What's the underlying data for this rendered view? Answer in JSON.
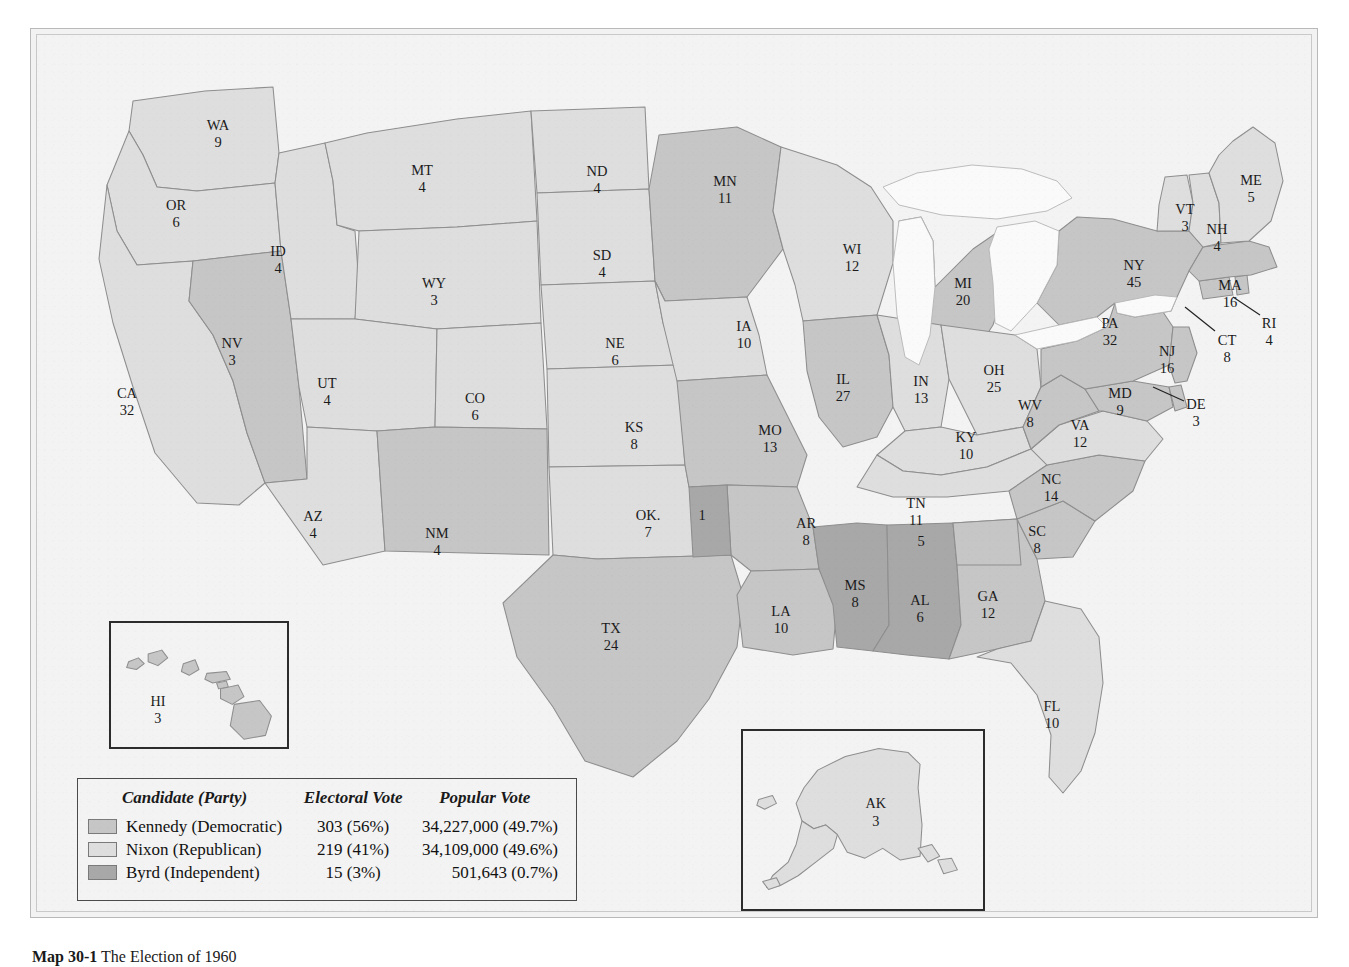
{
  "caption": {
    "label": "Map 30-1",
    "text": "The Election of 1960"
  },
  "colors": {
    "kennedy": "#c6c6c6",
    "nixon": "#dedede",
    "byrd": "#a8a8a8",
    "water": "#fafafa",
    "background": "#f3f3f3",
    "border": "#8e8e8e",
    "frame": "#b9b9b9"
  },
  "legend": {
    "headers": {
      "candidate": "Candidate (Party)",
      "electoral": "Electoral Vote",
      "popular": "Popular Vote"
    },
    "rows": [
      {
        "swatch": "kennedy",
        "candidate": "Kennedy (Democratic)",
        "electoral": "303 (56%)",
        "popular": "34,227,000 (49.7%)"
      },
      {
        "swatch": "nixon",
        "candidate": "Nixon (Republican)",
        "electoral": "219 (41%)",
        "popular": "34,109,000 (49.6%)"
      },
      {
        "swatch": "byrd",
        "candidate": "Byrd (Independent)",
        "electoral": "15 (3%)",
        "popular": "501,643 (0.7%)"
      }
    ]
  },
  "map": {
    "states": [
      {
        "code": "WA",
        "name": "Washington",
        "ev": "9",
        "winner": "nixon",
        "lx": 181,
        "ly": 92
      },
      {
        "code": "OR",
        "name": "Oregon",
        "ev": "6",
        "winner": "nixon",
        "lx": 139,
        "ly": 172
      },
      {
        "code": "CA",
        "name": "California",
        "ev": "32",
        "winner": "nixon",
        "lx": 90,
        "ly": 360
      },
      {
        "code": "NV",
        "name": "Nevada",
        "ev": "3",
        "winner": "kennedy",
        "lx": 195,
        "ly": 310
      },
      {
        "code": "ID",
        "name": "Idaho",
        "ev": "4",
        "winner": "nixon",
        "lx": 241,
        "ly": 218
      },
      {
        "code": "MT",
        "name": "Montana",
        "ev": "4",
        "winner": "nixon",
        "lx": 385,
        "ly": 137
      },
      {
        "code": "WY",
        "name": "Wyoming",
        "ev": "3",
        "winner": "nixon",
        "lx": 397,
        "ly": 250
      },
      {
        "code": "UT",
        "name": "Utah",
        "ev": "4",
        "winner": "nixon",
        "lx": 290,
        "ly": 350
      },
      {
        "code": "AZ",
        "name": "Arizona",
        "ev": "4",
        "winner": "nixon",
        "lx": 276,
        "ly": 483
      },
      {
        "code": "CO",
        "name": "Colorado",
        "ev": "6",
        "winner": "nixon",
        "lx": 438,
        "ly": 365
      },
      {
        "code": "NM",
        "name": "New Mexico",
        "ev": "4",
        "winner": "kennedy",
        "lx": 400,
        "ly": 500
      },
      {
        "code": "ND",
        "name": "North Dakota",
        "ev": "4",
        "winner": "nixon",
        "lx": 560,
        "ly": 138
      },
      {
        "code": "SD",
        "name": "South Dakota",
        "ev": "4",
        "winner": "nixon",
        "lx": 565,
        "ly": 222
      },
      {
        "code": "NE",
        "name": "Nebraska",
        "ev": "6",
        "winner": "nixon",
        "lx": 578,
        "ly": 310
      },
      {
        "code": "KS",
        "name": "Kansas",
        "ev": "8",
        "winner": "nixon",
        "lx": 597,
        "ly": 394
      },
      {
        "code": "OK.",
        "name": "Oklahoma",
        "ev": "7",
        "winner": "nixon",
        "lx": 611,
        "ly": 482
      },
      {
        "code": "TX",
        "name": "Texas",
        "ev": "24",
        "winner": "kennedy",
        "lx": 574,
        "ly": 595
      },
      {
        "code": "MN",
        "name": "Minnesota",
        "ev": "11",
        "winner": "kennedy",
        "lx": 688,
        "ly": 148
      },
      {
        "code": "IA",
        "name": "Iowa",
        "ev": "10",
        "winner": "nixon",
        "lx": 707,
        "ly": 293
      },
      {
        "code": "MO",
        "name": "Missouri",
        "ev": "13",
        "winner": "kennedy",
        "lx": 733,
        "ly": 397
      },
      {
        "code": "AR",
        "name": "Arkansas",
        "ev": "8",
        "winner": "kennedy",
        "lx": 769,
        "ly": 490
      },
      {
        "code": "LA",
        "name": "Louisiana",
        "ev": "10",
        "winner": "kennedy",
        "lx": 744,
        "ly": 578
      },
      {
        "code": "WI",
        "name": "Wisconsin",
        "ev": "12",
        "winner": "nixon",
        "lx": 815,
        "ly": 216
      },
      {
        "code": "IL",
        "name": "Illinois",
        "ev": "27",
        "winner": "kennedy",
        "lx": 806,
        "ly": 346
      },
      {
        "code": "MI",
        "name": "Michigan",
        "ev": "20",
        "winner": "kennedy",
        "lx": 926,
        "ly": 250
      },
      {
        "code": "IN",
        "name": "Indiana",
        "ev": "13",
        "winner": "nixon",
        "lx": 884,
        "ly": 348
      },
      {
        "code": "OH",
        "name": "Ohio",
        "ev": "25",
        "winner": "nixon",
        "lx": 957,
        "ly": 337
      },
      {
        "code": "KY",
        "name": "Kentucky",
        "ev": "10",
        "winner": "nixon",
        "lx": 929,
        "ly": 404
      },
      {
        "code": "TN",
        "name": "Tennessee",
        "ev": "11",
        "winner": "nixon",
        "lx": 879,
        "ly": 470
      },
      {
        "code": "MS",
        "name": "Mississippi",
        "ev": "8",
        "winner": "byrd",
        "lx": 818,
        "ly": 552
      },
      {
        "code": "AL",
        "name": "Alabama",
        "ev": "6",
        "winner": "byrd",
        "lx": 883,
        "ly": 567
      },
      {
        "code": "GA",
        "name": "Georgia",
        "ev": "12",
        "winner": "kennedy",
        "lx": 951,
        "ly": 563
      },
      {
        "code": "FL",
        "name": "Florida",
        "ev": "10",
        "winner": "nixon",
        "lx": 1015,
        "ly": 673
      },
      {
        "code": "SC",
        "name": "South Carolina",
        "ev": "8",
        "winner": "kennedy",
        "lx": 1000,
        "ly": 498
      },
      {
        "code": "NC",
        "name": "North Carolina",
        "ev": "14",
        "winner": "kennedy",
        "lx": 1014,
        "ly": 446
      },
      {
        "code": "VA",
        "name": "Virginia",
        "ev": "12",
        "winner": "nixon",
        "lx": 1043,
        "ly": 392
      },
      {
        "code": "WV",
        "name": "West Virginia",
        "ev": "8",
        "winner": "kennedy",
        "lx": 993,
        "ly": 372
      },
      {
        "code": "MD",
        "name": "Maryland",
        "ev": "9",
        "winner": "kennedy",
        "lx": 1083,
        "ly": 360
      },
      {
        "code": "DE",
        "name": "Delaware",
        "ev": "3",
        "winner": "kennedy",
        "lx": 1159,
        "ly": 371
      },
      {
        "code": "PA",
        "name": "Pennsylvania",
        "ev": "32",
        "winner": "kennedy",
        "lx": 1073,
        "ly": 290
      },
      {
        "code": "NJ",
        "name": "New Jersey",
        "ev": "16",
        "winner": "kennedy",
        "lx": 1130,
        "ly": 318
      },
      {
        "code": "NY",
        "name": "New York",
        "ev": "45",
        "winner": "kennedy",
        "lx": 1097,
        "ly": 232
      },
      {
        "code": "CT",
        "name": "Connecticut",
        "ev": "8",
        "winner": "kennedy",
        "lx": 1190,
        "ly": 307
      },
      {
        "code": "RI",
        "name": "Rhode Island",
        "ev": "4",
        "winner": "kennedy",
        "lx": 1232,
        "ly": 290
      },
      {
        "code": "MA",
        "name": "Massachusetts",
        "ev": "16",
        "winner": "kennedy",
        "lx": 1193,
        "ly": 252
      },
      {
        "code": "VT",
        "name": "Vermont",
        "ev": "3",
        "winner": "nixon",
        "lx": 1148,
        "ly": 176
      },
      {
        "code": "NH",
        "name": "New Hampshire",
        "ev": "4",
        "winner": "nixon",
        "lx": 1180,
        "ly": 196
      },
      {
        "code": "ME",
        "name": "Maine",
        "ev": "5",
        "winner": "nixon",
        "lx": 1214,
        "ly": 147
      }
    ],
    "split_districts": [
      {
        "id": "ok-byrd-sliver",
        "label": "1",
        "winner": "byrd",
        "lx": 665,
        "ly": 482,
        "state": "Oklahoma"
      },
      {
        "id": "al-kennedy",
        "label": "5",
        "winner": "kennedy",
        "lx": 884,
        "ly": 508,
        "state": "Alabama"
      }
    ],
    "insets": {
      "hawaii": {
        "code": "HI",
        "name": "Hawaii",
        "ev": "3",
        "winner": "kennedy"
      },
      "alaska": {
        "code": "AK",
        "name": "Alaska",
        "ev": "3",
        "winner": "nixon"
      }
    }
  }
}
